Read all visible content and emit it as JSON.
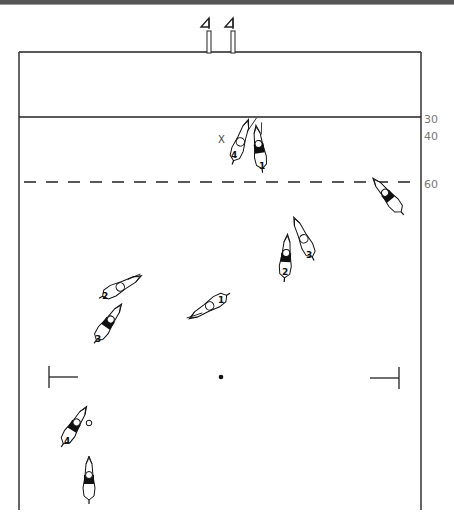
{
  "diagram": {
    "yard_markers": [
      "30",
      "40",
      "60"
    ],
    "ball_mark": "X",
    "colors": {
      "line": "#222222",
      "dark_team": "#111111",
      "light_team": "#ffffff",
      "label": "#777777"
    },
    "goal_posts": [
      {
        "name": "left-goal-post"
      },
      {
        "name": "right-goal-post"
      }
    ],
    "players": [
      {
        "id": "light-4-top",
        "number": "4",
        "team": "light"
      },
      {
        "id": "dark-1-top",
        "number": "1",
        "team": "dark"
      },
      {
        "id": "dark-right",
        "number": "",
        "team": "dark"
      },
      {
        "id": "dark-2-mid",
        "number": "2",
        "team": "dark"
      },
      {
        "id": "light-3-mid",
        "number": "3",
        "team": "light"
      },
      {
        "id": "light-2-left",
        "number": "2",
        "team": "light"
      },
      {
        "id": "dark-3-left",
        "number": "3",
        "team": "dark"
      },
      {
        "id": "light-1-center",
        "number": "1",
        "team": "light"
      },
      {
        "id": "dark-4-bottom",
        "number": "4",
        "team": "dark"
      },
      {
        "id": "dark-bottom",
        "number": "",
        "team": "dark"
      }
    ]
  }
}
